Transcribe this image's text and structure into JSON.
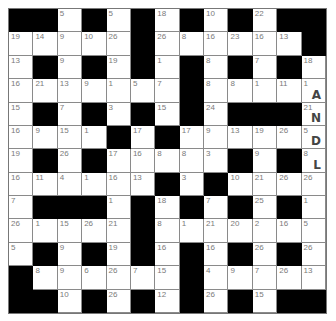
{
  "puzzle": {
    "type": "codeword",
    "rows": 13,
    "cols": 13,
    "grid": [
      [
        null,
        null,
        5,
        null,
        5,
        null,
        18,
        null,
        10,
        null,
        22,
        null,
        null
      ],
      [
        19,
        14,
        9,
        10,
        26,
        null,
        26,
        8,
        16,
        23,
        16,
        13,
        null
      ],
      [
        13,
        null,
        9,
        null,
        19,
        null,
        1,
        null,
        8,
        null,
        7,
        null,
        18
      ],
      [
        16,
        21,
        13,
        9,
        1,
        5,
        7,
        null,
        8,
        8,
        1,
        11,
        1
      ],
      [
        15,
        null,
        7,
        null,
        3,
        null,
        15,
        null,
        24,
        null,
        null,
        null,
        21
      ],
      [
        16,
        9,
        15,
        1,
        null,
        17,
        null,
        17,
        9,
        13,
        19,
        26,
        5
      ],
      [
        19,
        null,
        26,
        null,
        17,
        16,
        8,
        8,
        3,
        null,
        9,
        null,
        8
      ],
      [
        16,
        11,
        4,
        1,
        16,
        13,
        null,
        3,
        null,
        10,
        21,
        26,
        26
      ],
      [
        7,
        null,
        null,
        null,
        1,
        null,
        18,
        null,
        7,
        null,
        25,
        null,
        1
      ],
      [
        26,
        1,
        15,
        26,
        21,
        null,
        8,
        1,
        21,
        20,
        2,
        16,
        5
      ],
      [
        5,
        null,
        9,
        null,
        19,
        null,
        16,
        null,
        16,
        null,
        26,
        null,
        26
      ],
      [
        null,
        8,
        9,
        6,
        26,
        7,
        15,
        null,
        4,
        9,
        7,
        26,
        13
      ],
      [
        null,
        null,
        10,
        null,
        26,
        null,
        12,
        null,
        26,
        null,
        15,
        null,
        null
      ]
    ],
    "solved_letters": [
      {
        "row": 3,
        "col": 12,
        "number": 1,
        "letter": "A"
      },
      {
        "row": 4,
        "col": 12,
        "number": 21,
        "letter": "N"
      },
      {
        "row": 5,
        "col": 12,
        "number": 5,
        "letter": "D"
      },
      {
        "row": 6,
        "col": 12,
        "number": 8,
        "letter": "L"
      }
    ]
  }
}
